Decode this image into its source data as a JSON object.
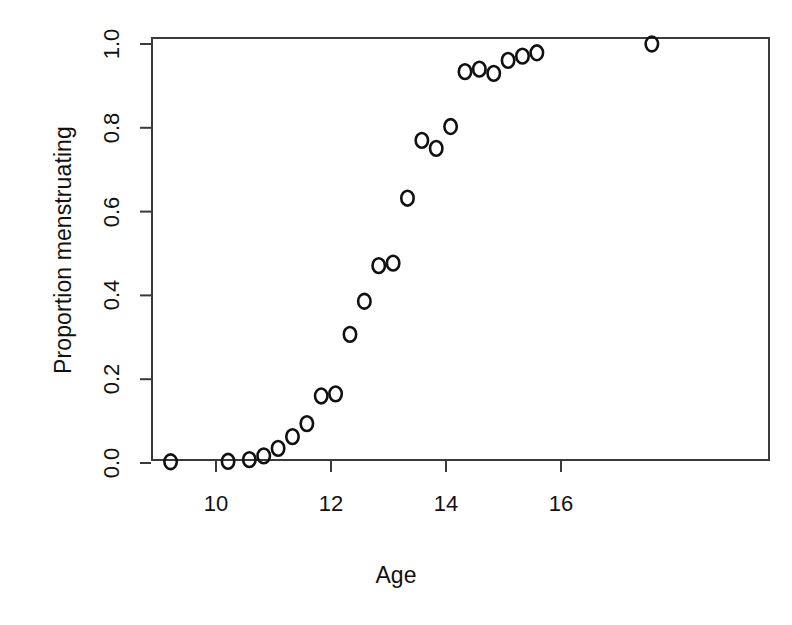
{
  "chart_data": {
    "type": "scatter",
    "title": "",
    "xlabel": "Age",
    "ylabel": "Proportion menstruating",
    "xlim": [
      8.7,
      17.9
    ],
    "ylim": [
      -0.02,
      1.03
    ],
    "grid": false,
    "legend": null,
    "marker": "open-circle",
    "xticks": [
      10,
      12,
      14,
      16
    ],
    "xtick_labels": [
      "10",
      "12",
      "14",
      "16"
    ],
    "yticks": [
      0.0,
      0.2,
      0.4,
      0.6,
      0.8,
      1.0
    ],
    "ytick_labels": [
      "0.0",
      "0.2",
      "0.4",
      "0.6",
      "0.8",
      "1.0"
    ],
    "x": [
      9.21,
      10.21,
      10.58,
      10.83,
      11.08,
      11.33,
      11.58,
      11.83,
      12.08,
      12.33,
      12.58,
      12.83,
      13.08,
      13.33,
      13.58,
      13.83,
      14.08,
      14.33,
      14.58,
      14.83,
      15.08,
      15.33,
      15.58,
      17.58
    ],
    "y": [
      0.003,
      0.004,
      0.008,
      0.017,
      0.035,
      0.063,
      0.094,
      0.16,
      0.165,
      0.307,
      0.386,
      0.471,
      0.477,
      0.632,
      0.77,
      0.751,
      0.803,
      0.934,
      0.94,
      0.93,
      0.961,
      0.971,
      0.979,
      1.0
    ],
    "series": [
      {
        "name": "Proportion menstruating",
        "points": [
          {
            "x": 9.21,
            "y": 0.003
          },
          {
            "x": 10.21,
            "y": 0.004
          },
          {
            "x": 10.58,
            "y": 0.008
          },
          {
            "x": 10.83,
            "y": 0.017
          },
          {
            "x": 11.08,
            "y": 0.035
          },
          {
            "x": 11.33,
            "y": 0.063
          },
          {
            "x": 11.58,
            "y": 0.094
          },
          {
            "x": 11.83,
            "y": 0.16
          },
          {
            "x": 12.08,
            "y": 0.165
          },
          {
            "x": 12.33,
            "y": 0.307
          },
          {
            "x": 12.58,
            "y": 0.386
          },
          {
            "x": 12.83,
            "y": 0.471
          },
          {
            "x": 13.08,
            "y": 0.477
          },
          {
            "x": 13.33,
            "y": 0.632
          },
          {
            "x": 13.58,
            "y": 0.77
          },
          {
            "x": 13.83,
            "y": 0.751
          },
          {
            "x": 14.08,
            "y": 0.803
          },
          {
            "x": 14.33,
            "y": 0.934
          },
          {
            "x": 14.58,
            "y": 0.94
          },
          {
            "x": 14.83,
            "y": 0.93
          },
          {
            "x": 15.08,
            "y": 0.961
          },
          {
            "x": 15.33,
            "y": 0.971
          },
          {
            "x": 15.58,
            "y": 0.979
          },
          {
            "x": 17.58,
            "y": 1.0
          }
        ]
      }
    ]
  },
  "axes": {
    "x_title": "Age",
    "y_title": "Proportion menstruating",
    "x_tick_labels": [
      "10",
      "12",
      "14",
      "16"
    ],
    "y_tick_labels": [
      "0.0",
      "0.2",
      "0.4",
      "0.6",
      "0.8",
      "1.0"
    ]
  },
  "colors": {
    "marker_stroke": "#111111",
    "frame": "#3a3a3a",
    "background": "#ffffff",
    "text": "#111111"
  }
}
